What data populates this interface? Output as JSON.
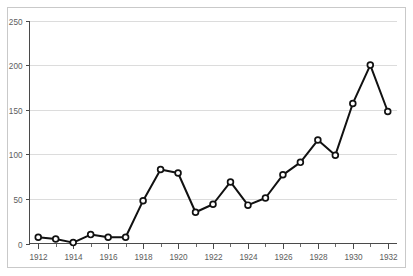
{
  "chart_data": {
    "type": "line",
    "title": "",
    "subtitle": "",
    "xlabel": "",
    "ylabel": "",
    "x": [
      1912,
      1913,
      1914,
      1915,
      1916,
      1917,
      1918,
      1919,
      1920,
      1921,
      1922,
      1923,
      1924,
      1925,
      1926,
      1927,
      1928,
      1929,
      1930,
      1931,
      1932
    ],
    "values": [
      7,
      5,
      1,
      10,
      7,
      7,
      48,
      83,
      79,
      35,
      44,
      69,
      43,
      51,
      77,
      91,
      116,
      99,
      157,
      200,
      148
    ],
    "series": [
      {
        "name": "series-1",
        "values": [
          7,
          5,
          1,
          10,
          7,
          7,
          48,
          83,
          79,
          35,
          44,
          69,
          43,
          51,
          77,
          91,
          116,
          99,
          157,
          200,
          148
        ]
      }
    ],
    "xlim": [
      1911.5,
      1932.5
    ],
    "ylim": [
      0,
      250
    ],
    "y_ticks": [
      0,
      50,
      100,
      150,
      200,
      250
    ],
    "y_tick_labels": [
      "0",
      "50",
      "100",
      "150",
      "200",
      "250"
    ],
    "x_ticks_major": [
      1912,
      1914,
      1916,
      1918,
      1920,
      1922,
      1924,
      1926,
      1928,
      1930,
      1932
    ],
    "x_tick_labels": [
      "1912",
      "1914",
      "1916",
      "1918",
      "1920",
      "1922",
      "1924",
      "1926",
      "1928",
      "1930",
      "1932"
    ],
    "x_ticks_minor": [
      1913,
      1915,
      1917,
      1919,
      1921,
      1923,
      1925,
      1927,
      1929,
      1931
    ],
    "grid": "horizontal",
    "legend": "none",
    "marker": "open-circle",
    "colors": {
      "line": "#111111",
      "marker_fill": "#ffffff",
      "marker_stroke": "#111111",
      "gridline": "#dcdcdc",
      "axis": "#4a4a4a",
      "tick_label": "#5d5d5d",
      "frame_border": "#c9c9c9",
      "background": "#ffffff"
    }
  }
}
